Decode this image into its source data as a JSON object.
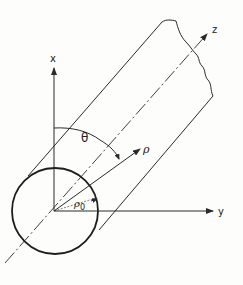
{
  "diagram": {
    "type": "cylinder-coordinate-diagram",
    "labels": {
      "x_axis": "x",
      "y_axis": "y",
      "z_axis": "z",
      "rho": "ρ",
      "rho0_base": "ρ",
      "rho0_sub": "0",
      "theta": "θ"
    },
    "colors": {
      "line": "#2a2a2a",
      "background": "#fdfdfb"
    }
  }
}
